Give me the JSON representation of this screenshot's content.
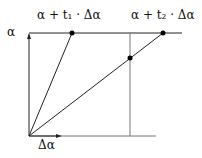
{
  "labels": {
    "alpha": "α",
    "t1_point": "α + t₁ · Δα",
    "t2_point": "α + t₂ · Δα",
    "delta_alpha": "Δα"
  },
  "colors": {
    "line": "#111111",
    "light_line": "#777777"
  }
}
